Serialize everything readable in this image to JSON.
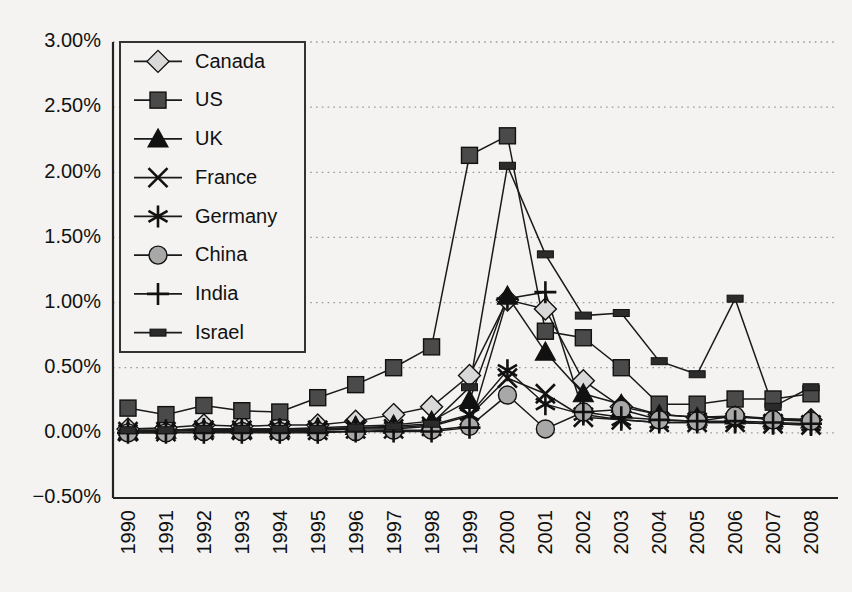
{
  "chart_data": {
    "type": "line",
    "title": "",
    "subtitle": "",
    "xlabel": "",
    "ylabel": "",
    "grid": true,
    "legend_position": "inside-top-left",
    "categories": [
      "1990",
      "1991",
      "1992",
      "1993",
      "1994",
      "1995",
      "1996",
      "1997",
      "1998",
      "1999",
      "2000",
      "2001",
      "2002",
      "2003",
      "2004",
      "2005",
      "2006",
      "2007",
      "2008"
    ],
    "x": [
      1990,
      1991,
      1992,
      1993,
      1994,
      1995,
      1996,
      1997,
      1998,
      1999,
      2000,
      2001,
      2002,
      2003,
      2004,
      2005,
      2006,
      2007,
      2008
    ],
    "ytick_labels": [
      "3.00%",
      "2.50%",
      "2.00%",
      "1.50%",
      "1.00%",
      "0.50%",
      "0.00%",
      "-0.50%"
    ],
    "ytick_values": [
      3.0,
      2.5,
      2.0,
      1.5,
      1.0,
      0.5,
      0.0,
      -0.5
    ],
    "ylim": [
      -0.5,
      3.0
    ],
    "yunit": "%",
    "series": [
      {
        "name": "Canada",
        "marker": "diamond",
        "color": "#d9d9d9",
        "values": [
          0.03,
          0.04,
          0.06,
          0.05,
          0.06,
          0.06,
          0.09,
          0.14,
          0.2,
          0.44,
          1.02,
          0.95,
          0.4,
          0.2,
          0.14,
          0.12,
          0.12,
          0.11,
          0.1
        ]
      },
      {
        "name": "US",
        "marker": "square",
        "color": "#4a4a4a",
        "values": [
          0.19,
          0.14,
          0.21,
          0.17,
          0.16,
          0.27,
          0.37,
          0.5,
          0.66,
          2.13,
          2.28,
          0.78,
          0.73,
          0.5,
          0.22,
          0.22,
          0.26,
          0.26,
          0.3
        ]
      },
      {
        "name": "UK",
        "marker": "triangle",
        "color": "#111111",
        "values": [
          0.01,
          0.02,
          0.03,
          0.02,
          0.03,
          0.04,
          0.05,
          0.06,
          0.09,
          0.25,
          1.05,
          0.62,
          0.3,
          0.22,
          0.14,
          0.12,
          0.13,
          0.11,
          0.1
        ]
      },
      {
        "name": "France",
        "marker": "cross-x",
        "color": "#111111",
        "values": [
          0.01,
          0.01,
          0.02,
          0.02,
          0.02,
          0.02,
          0.03,
          0.03,
          0.05,
          0.13,
          0.42,
          0.3,
          0.12,
          0.1,
          0.08,
          0.08,
          0.08,
          0.07,
          0.06
        ]
      },
      {
        "name": "Germany",
        "marker": "asterisk",
        "color": "#111111",
        "values": [
          0.02,
          0.02,
          0.03,
          0.03,
          0.03,
          0.03,
          0.04,
          0.04,
          0.06,
          0.14,
          0.48,
          0.22,
          0.14,
          0.1,
          0.08,
          0.08,
          0.08,
          0.07,
          0.06
        ]
      },
      {
        "name": "China",
        "marker": "circle",
        "color": "#a8a8a8",
        "values": [
          0.0,
          0.0,
          0.01,
          0.01,
          0.01,
          0.01,
          0.01,
          0.02,
          0.02,
          0.05,
          0.29,
          0.03,
          0.16,
          0.18,
          0.1,
          0.09,
          0.13,
          0.1,
          0.09
        ]
      },
      {
        "name": "India",
        "marker": "plus",
        "color": "#111111",
        "values": [
          0.0,
          0.0,
          0.0,
          0.0,
          0.0,
          0.0,
          0.01,
          0.01,
          0.01,
          0.04,
          1.03,
          1.08,
          0.16,
          0.12,
          0.1,
          0.09,
          0.09,
          0.08,
          0.07
        ]
      },
      {
        "name": "Israel",
        "marker": "dash",
        "color": "#2b2b2b",
        "values": [
          0.02,
          0.02,
          0.03,
          0.03,
          0.03,
          0.03,
          0.04,
          0.05,
          0.07,
          0.35,
          2.05,
          1.37,
          0.9,
          0.92,
          0.55,
          0.45,
          1.03,
          0.2,
          0.35
        ]
      }
    ]
  }
}
